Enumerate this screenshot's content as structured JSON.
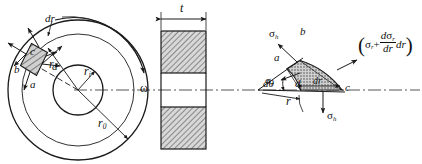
{
  "figure": {
    "stroke_color": "#1a1a1a",
    "hatch_color": "#555555",
    "fill_color": "#b8b8b8"
  },
  "front_view": {
    "name": "rotating-disk-front-view",
    "outer_radius_label": "r",
    "outer_radius_sub": "0",
    "inner_radius_label": "r",
    "inner_radius_sub": "i",
    "radius_label": "r",
    "angular_velocity_label": "ω",
    "element_thickness_label": "dr",
    "element_corners": {
      "a": "a",
      "b": "b",
      "c": "c",
      "d": "d"
    }
  },
  "side_view": {
    "name": "disk-side-section-view",
    "thickness_label": "t"
  },
  "detail_view": {
    "name": "stress-element-detail-view",
    "corner_a": "a",
    "corner_b": "b",
    "corner_c": "c",
    "corner_d": "d",
    "hoop_stress_top": "σ",
    "hoop_stress_top_sub": "h",
    "hoop_stress_bottom": "σ",
    "hoop_stress_bottom_sub": "h",
    "radial_stress": "σ",
    "radial_stress_sub": "r",
    "angle_label": "dθ",
    "radius_label": "r",
    "element_width_label": "dr",
    "radial_stress_gradient": {
      "open_paren": "(",
      "sigma": "σ",
      "sigma_sub": "r",
      "plus": "+",
      "numerator_d": "d",
      "numerator_sigma": "σ",
      "numerator_sub": "r",
      "denominator": "dr",
      "trailing": "dr",
      "close_paren": ")"
    }
  }
}
